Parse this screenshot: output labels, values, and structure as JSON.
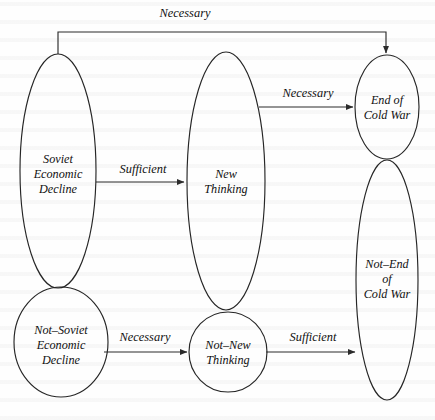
{
  "diagram": {
    "type": "causal-necessity-sufficiency-diagram",
    "background_color": "#fefefe",
    "stroke_color": "#262626",
    "text_color": "#111111",
    "nodes": [
      {
        "id": "soviet-economic-decline",
        "label_lines": [
          "Soviet",
          "Economic",
          "Decline"
        ],
        "shape": "ellipse",
        "cx": 58,
        "cy": 171,
        "rx": 38,
        "ry": 117
      },
      {
        "id": "not-soviet-economic-decline",
        "label_lines": [
          "Not–Soviet",
          "Economic",
          "Decline"
        ],
        "shape": "ellipse",
        "cx": 61,
        "cy": 342,
        "rx": 47,
        "ry": 55
      },
      {
        "id": "new-thinking",
        "label_lines": [
          "New",
          "Thinking"
        ],
        "shape": "ellipse",
        "cx": 226,
        "cy": 181,
        "rx": 39,
        "ry": 129
      },
      {
        "id": "not-new-thinking",
        "label_lines": [
          "Not–New",
          "Thinking"
        ],
        "shape": "ellipse",
        "cx": 228,
        "cy": 352,
        "rx": 39,
        "ry": 40
      },
      {
        "id": "end-of-cold-war",
        "label_lines": [
          "End of",
          "Cold War"
        ],
        "shape": "ellipse",
        "cx": 387,
        "cy": 107,
        "rx": 32,
        "ry": 52
      },
      {
        "id": "not-end-of-cold-war",
        "label_lines": [
          "Not–End",
          "of",
          "Cold War"
        ],
        "shape": "ellipse",
        "cx": 387,
        "cy": 280,
        "rx": 31,
        "ry": 120
      }
    ],
    "edges": [
      {
        "id": "edge-soviet-decline-to-end-of-cold-war",
        "label": "Necessary",
        "from": "soviet-economic-decline",
        "to": "end-of-cold-war",
        "routing": "orthogonal-top",
        "label_x": 185,
        "label_y": 14
      },
      {
        "id": "edge-soviet-decline-to-new-thinking",
        "label": "Sufficient",
        "from": "soviet-economic-decline",
        "to": "new-thinking",
        "routing": "straight",
        "label_x": 143,
        "label_y": 170
      },
      {
        "id": "edge-new-thinking-to-end-of-cold-war",
        "label": "Necessary",
        "from": "new-thinking",
        "to": "end-of-cold-war",
        "routing": "straight",
        "label_x": 308,
        "label_y": 94
      },
      {
        "id": "edge-not-soviet-decline-to-not-new-thinking",
        "label": "Necessary",
        "from": "not-soviet-economic-decline",
        "to": "not-new-thinking",
        "routing": "straight",
        "label_x": 145,
        "label_y": 338
      },
      {
        "id": "edge-not-new-thinking-to-not-end-of-cold-war",
        "label": "Sufficient",
        "from": "not-new-thinking",
        "to": "not-end-of-cold-war",
        "routing": "straight",
        "label_x": 313,
        "label_y": 338
      }
    ]
  }
}
